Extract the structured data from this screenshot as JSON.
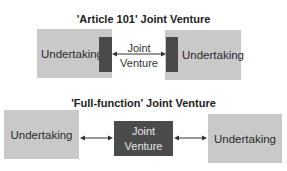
{
  "top_section": {
    "title": "'Article 101' Joint Venture",
    "left_box": {
      "label": "Undertaking"
    },
    "right_box": {
      "label": "Undertaking"
    },
    "center": {
      "line1": "Joint",
      "line2": "Venture"
    }
  },
  "bottom_section": {
    "title": "'Full-function' Joint Venture",
    "left_box": {
      "label": "Undertaking"
    },
    "right_box": {
      "label": "Undertaking"
    },
    "center": {
      "line1": "Joint",
      "line2": "Venture"
    }
  },
  "colors": {
    "box_fill": "#c9c9c9",
    "dark_fill": "#4a4a4a",
    "text": "#222222"
  }
}
